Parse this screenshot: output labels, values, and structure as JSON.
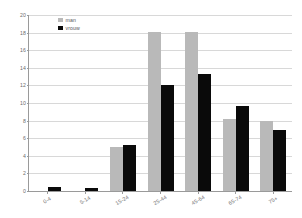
{
  "chart_data": {
    "type": "bar",
    "title": "",
    "subtitle": "",
    "xlabel": "",
    "ylabel": "",
    "categories": [
      "0-4",
      "5-14",
      "15-24",
      "25-44",
      "45-64",
      "65-74",
      "75+"
    ],
    "series": [
      {
        "name": "man",
        "color": "#b9b9b9",
        "values": [
          0,
          0,
          5.0,
          18.1,
          18.1,
          8.2,
          8.0
        ]
      },
      {
        "name": "vrouw",
        "color": "#0a0a0a",
        "values": [
          0.4,
          0.3,
          5.2,
          12.0,
          13.3,
          9.7,
          6.9
        ]
      }
    ],
    "ylim": [
      0,
      20
    ],
    "yticks": [
      0,
      2,
      4,
      6,
      8,
      10,
      12,
      14,
      16,
      18,
      20
    ],
    "ytick_labels": [
      "0",
      "2",
      "4",
      "6",
      "8",
      "10",
      "12",
      "14",
      "16",
      "18",
      "20"
    ],
    "grid": true,
    "grid_axis": "y",
    "legend_position": "top-left",
    "bar_orientation": "vertical",
    "annotations": []
  },
  "legend": {
    "entries": [
      {
        "label": "man",
        "swatch": "man"
      },
      {
        "label": "vrouw",
        "swatch": "vrouw"
      }
    ]
  },
  "colors": {
    "man": "#b9b9b9",
    "vrouw": "#0a0a0a",
    "grid": "#d8d8d8",
    "axis": "#9a9a9a",
    "tick_text": "#6d6d6d",
    "background": "#ffffff"
  }
}
